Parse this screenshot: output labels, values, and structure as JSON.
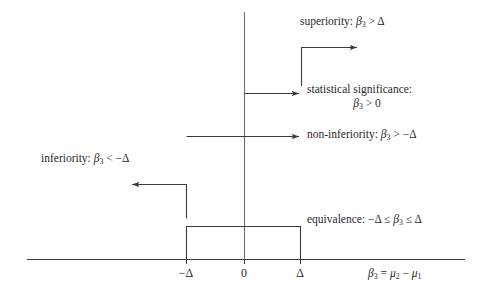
{
  "figure": {
    "background_color": "#ffffff",
    "line_color": "#3a3a3a",
    "text_color": "#2a2a2a"
  },
  "labels": {
    "superiority": "superiority: β3 > Δ",
    "statistical_significance_line1": "statistical significance:",
    "statistical_significance_line2": "β3 > 0",
    "non_inferiority": "non-inferiority: β3 > −Δ",
    "inferiority": "inferiority: β3 < −Δ",
    "equivalence": "equivalence: −Δ ≤ β3 ≤ Δ",
    "x_axis_label": "β3 = μ2 − μ1"
  },
  "axis": {
    "ticks": [
      {
        "name": "neg-delta",
        "label": "−Δ",
        "value": -1
      },
      {
        "name": "zero",
        "label": "0",
        "value": 0
      },
      {
        "name": "pos-delta",
        "label": "Δ",
        "value": 1
      }
    ]
  },
  "chart_data": {
    "type": "diagram",
    "xlabel": "β3 = μ2 − μ1",
    "ylabel": "",
    "grid": false,
    "legend": "none",
    "x_ticks": [
      "−Δ",
      "0",
      "Δ"
    ],
    "x_tick_values": [
      -1,
      0,
      1
    ],
    "regions": [
      {
        "name": "superiority",
        "label": "superiority: β3 > Δ",
        "condition": "β3 > Δ",
        "interval_start": 1,
        "interval_end": "+∞",
        "direction": "right-open"
      },
      {
        "name": "statistical-significance",
        "label": "statistical significance: β3 > 0",
        "condition": "β3 > 0",
        "interval_start": 0,
        "interval_end": "+∞",
        "direction": "right-open"
      },
      {
        "name": "non-inferiority",
        "label": "non-inferiority: β3 > −Δ",
        "condition": "β3 > −Δ",
        "interval_start": -1,
        "interval_end": "+∞",
        "direction": "right-open"
      },
      {
        "name": "inferiority",
        "label": "inferiority: β3 < −Δ",
        "condition": "β3 < −Δ",
        "interval_start": "−∞",
        "interval_end": -1,
        "direction": "left-open"
      },
      {
        "name": "equivalence",
        "label": "equivalence: −Δ ≤ β3 ≤ Δ",
        "condition": "−Δ ≤ β3 ≤ Δ",
        "interval_start": -1,
        "interval_end": 1,
        "direction": "closed-box"
      }
    ]
  }
}
